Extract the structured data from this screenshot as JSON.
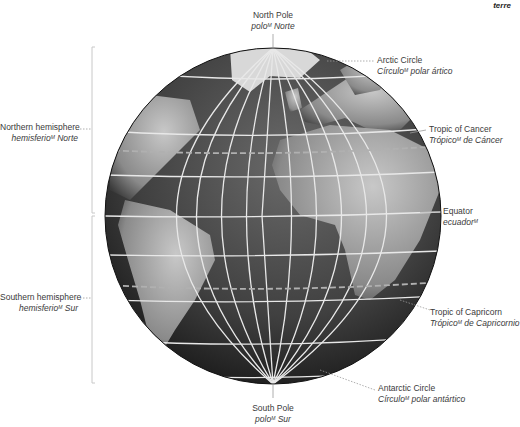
{
  "corner_tag": "terre",
  "labels": {
    "north_pole": {
      "en": "North Pole",
      "es": "polo",
      "gender": "M",
      "es_tail": " Norte"
    },
    "south_pole": {
      "en": "South Pole",
      "es": "polo",
      "gender": "M",
      "es_tail": " Sur"
    },
    "arctic_circle": {
      "en": "Arctic Circle",
      "es": "Círculo",
      "gender": "M",
      "es_tail": " polar ártico"
    },
    "tropic_cancer": {
      "en": "Tropic of Cancer",
      "es": "Trópico",
      "gender": "M",
      "es_tail": " de Cáncer"
    },
    "equator": {
      "en": "Equator",
      "es": "ecuador",
      "gender": "M",
      "es_tail": ""
    },
    "tropic_capricorn": {
      "en": "Tropic of Capricorn",
      "es": "Trópico",
      "gender": "M",
      "es_tail": " de Capricornio"
    },
    "antarctic_circle": {
      "en": "Antarctic Circle",
      "es": "Círculo",
      "gender": "M",
      "es_tail": " polar antártico"
    },
    "northern_hemisphere": {
      "en": "Northern hemisphere",
      "es": "hemisferio",
      "gender": "M",
      "es_tail": " Norte"
    },
    "southern_hemisphere": {
      "en": "Southern hemisphere",
      "es": "hemisferio",
      "gender": "M",
      "es_tail": " Sur"
    }
  },
  "colors": {
    "ocean": "#3a3a3a",
    "land": "#8c8c8c",
    "grid": "#e6e6e6",
    "leader": "#9a9a9a",
    "bracket": "#c8c8c8"
  }
}
